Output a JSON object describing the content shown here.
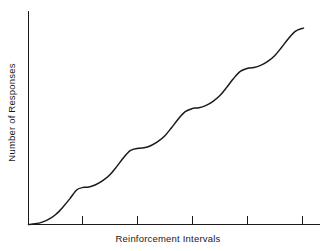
{
  "chart_data": {
    "type": "line",
    "title": "",
    "subtitle": "",
    "xlabel": "Reinforcement Intervals",
    "ylabel": "Number of Responses",
    "grid": false,
    "legend": null,
    "xlim": [
      0,
      5.3
    ],
    "ylim": [
      0,
      100
    ],
    "xticks": [
      1,
      2,
      3,
      4,
      5
    ],
    "xticklabels": [
      "",
      "",
      "",
      "",
      ""
    ],
    "yticks": [],
    "yticklabels": [],
    "annotations": [],
    "series": [
      {
        "name": "Cumulative responses",
        "description": "Fixed-interval scallop: post-reinforcement pause followed by accelerating responding, repeating each interval",
        "x": [
          0.0,
          0.12,
          0.25,
          0.38,
          0.5,
          0.62,
          0.75,
          0.88,
          1.0,
          1.1,
          1.22,
          1.35,
          1.48,
          1.6,
          1.72,
          1.85,
          2.0,
          2.1,
          2.22,
          2.35,
          2.48,
          2.6,
          2.72,
          2.85,
          3.0,
          3.1,
          3.22,
          3.35,
          3.48,
          3.6,
          3.72,
          3.85,
          4.0,
          4.1,
          4.22,
          4.35,
          4.48,
          4.6,
          4.72,
          4.85,
          5.0
        ],
        "y": [
          0.0,
          0.3,
          1.1,
          2.6,
          4.8,
          8.0,
          12.0,
          16.3,
          17.4,
          17.6,
          18.6,
          20.5,
          23.3,
          27.0,
          31.0,
          34.6,
          35.7,
          35.9,
          36.9,
          38.8,
          41.6,
          45.3,
          49.3,
          52.9,
          54.5,
          54.7,
          55.7,
          57.6,
          60.4,
          64.1,
          68.1,
          71.7,
          73.3,
          73.5,
          74.5,
          76.4,
          79.2,
          82.9,
          86.9,
          90.5,
          92.0
        ]
      }
    ],
    "reinforcement_points": [
      {
        "interval": 1,
        "x": 1,
        "y": 17.4
      },
      {
        "interval": 2,
        "x": 2,
        "y": 35.7
      },
      {
        "interval": 3,
        "x": 3,
        "y": 54.5
      },
      {
        "interval": 4,
        "x": 4,
        "y": 73.3
      },
      {
        "interval": 5,
        "x": 5,
        "y": 92.0
      }
    ],
    "colors": {
      "curve": "#1a1a1a",
      "axis": "#1a1a1a",
      "background": "#ffffff"
    }
  },
  "axes": {
    "x_title": "Reinforcement Intervals",
    "y_title": "Number of Responses"
  }
}
